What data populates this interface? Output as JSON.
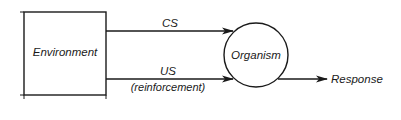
{
  "diagram": {
    "nodes": {
      "environment": {
        "label": "Environment",
        "shape": "rectangle"
      },
      "organism": {
        "label": "Organism",
        "shape": "circle"
      }
    },
    "edges": {
      "cs": {
        "label": "CS",
        "from": "Environment",
        "to": "Organism"
      },
      "us": {
        "label": "US",
        "sublabel": "(reinforcement)",
        "from": "Environment",
        "to": "Organism"
      },
      "response": {
        "label": "Response",
        "from": "Organism",
        "to": ""
      }
    },
    "colors": {
      "stroke": "#1a1a1a",
      "background": "#ffffff"
    }
  }
}
